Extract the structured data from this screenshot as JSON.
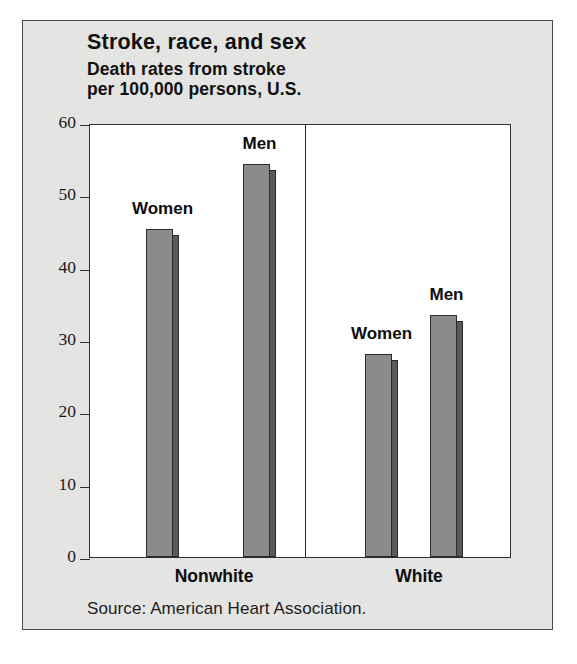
{
  "figure": {
    "title": "Stroke, race, and sex",
    "subtitle": "Death rates from stroke\nper 100,000 persons, U.S.",
    "source": "Source: American Heart Association."
  },
  "chart_data": {
    "type": "bar",
    "title": "Stroke, race, and sex",
    "subtitle": "Death rates from stroke per 100,000 persons, U.S.",
    "xlabel": "",
    "ylabel": "Death rates from stroke per 100,000 persons",
    "ylim": [
      0,
      60
    ],
    "yticks": [
      0,
      10,
      20,
      30,
      40,
      50,
      60
    ],
    "ytick_labels": [
      "0",
      "10",
      "20",
      "30",
      "40",
      "50",
      "60"
    ],
    "grid": false,
    "legend": "none",
    "categories": [
      "Nonwhite",
      "White"
    ],
    "series": [
      {
        "name": "Women",
        "values": [
          45.3,
          28.0
        ]
      },
      {
        "name": "Men",
        "values": [
          54.4,
          33.4
        ]
      }
    ],
    "bars": [
      {
        "group": "Nonwhite",
        "label": "Women",
        "value": 45.3
      },
      {
        "group": "Nonwhite",
        "label": "Men",
        "value": 54.4
      },
      {
        "group": "White",
        "label": "Women",
        "value": 28.0
      },
      {
        "group": "White",
        "label": "Men",
        "value": 33.4
      }
    ],
    "annotation": "Source: American Heart Association.",
    "colors": {
      "bar_fill": "#8b8b8b",
      "bar_shadow": "#5a5a5a",
      "bar_outline": "#2b2b2b",
      "panel_background": "#e4e4e3",
      "plot_background": "#ffffff",
      "text": "#111111"
    }
  }
}
